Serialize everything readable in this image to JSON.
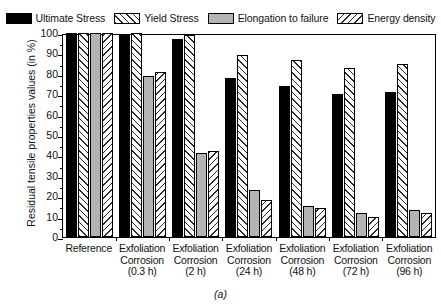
{
  "chart_data": {
    "type": "bar",
    "title": "",
    "caption": "(a)",
    "xlabel": "",
    "ylabel": "Residual tensile properties values (in %)",
    "ylim": [
      0,
      100
    ],
    "yticks": [
      0,
      10,
      20,
      30,
      40,
      50,
      60,
      70,
      80,
      90,
      100
    ],
    "grid": false,
    "legend_position": "top",
    "categories": [
      "Reference",
      "Exfoliation Corrosion (0.3 h)",
      "Exfoliation Corrosion (2 h)",
      "Exfoliation Corrosion (24 h)",
      "Exfoliation Corrosion (48 h)",
      "Exfoliation Corrosion (72 h)",
      "Exfoliation Corrosion (96 h)"
    ],
    "category_lines": [
      [
        "Reference"
      ],
      [
        "Exfoliation",
        "Corrosion",
        "(0.3 h)"
      ],
      [
        "Exfoliation",
        "Corrosion",
        "(2 h)"
      ],
      [
        "Exfoliation",
        "Corrosion",
        "(24 h)"
      ],
      [
        "Exfoliation",
        "Corrosion",
        "(48 h)"
      ],
      [
        "Exfoliation",
        "Corrosion",
        "(72 h)"
      ],
      [
        "Exfoliation",
        "Corrosion",
        "(96 h)"
      ]
    ],
    "series": [
      {
        "name": "Ultimate Stress",
        "fill": "solid-black",
        "values": [
          100,
          99,
          97,
          78,
          74,
          70,
          71
        ]
      },
      {
        "name": "Yield Stress",
        "fill": "hatch-up",
        "values": [
          100,
          100,
          99,
          89,
          87,
          83,
          85
        ]
      },
      {
        "name": "Elongation to failure",
        "fill": "solid-gray",
        "values": [
          100,
          79,
          41,
          23,
          15,
          12,
          13
        ]
      },
      {
        "name": "Energy density",
        "fill": "hatch-down",
        "values": [
          100,
          81,
          42,
          18,
          14,
          10,
          12
        ]
      }
    ]
  },
  "colors": {
    "ultimate_stress": "#000000",
    "elongation": "#b4b4b4",
    "hatch_line": "#2a2a2a",
    "axis": "#000000",
    "background": "#ffffff"
  }
}
